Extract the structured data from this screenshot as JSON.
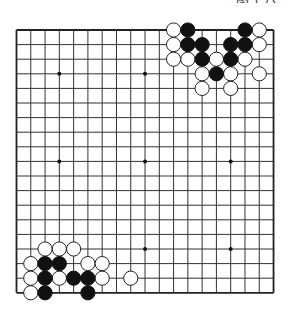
{
  "caption": {
    "text": "图十八",
    "clipped": true
  },
  "board": {
    "size": 19,
    "origin_x": 16.5,
    "origin_y": 30,
    "spacing_x": 14.28,
    "spacing_y": 14.6,
    "line_color": "#333333",
    "border_color": "#222222",
    "hoshi": [
      [
        3,
        3
      ],
      [
        3,
        9
      ],
      [
        3,
        15
      ],
      [
        9,
        3
      ],
      [
        9,
        9
      ],
      [
        9,
        15
      ],
      [
        15,
        3
      ],
      [
        15,
        9
      ],
      [
        15,
        15
      ]
    ],
    "stones": {
      "black": [
        [
          0,
          12
        ],
        [
          0,
          16
        ],
        [
          1,
          12
        ],
        [
          1,
          13
        ],
        [
          1,
          15
        ],
        [
          1,
          16
        ],
        [
          2,
          13
        ],
        [
          2,
          15
        ],
        [
          3,
          14
        ],
        [
          16,
          2
        ],
        [
          16,
          3
        ],
        [
          17,
          2
        ],
        [
          17,
          4
        ],
        [
          17,
          5
        ],
        [
          18,
          2
        ],
        [
          18,
          5
        ]
      ],
      "white": [
        [
          0,
          11
        ],
        [
          0,
          17
        ],
        [
          1,
          11
        ],
        [
          1,
          17
        ],
        [
          2,
          11
        ],
        [
          2,
          12
        ],
        [
          2,
          14
        ],
        [
          2,
          16
        ],
        [
          3,
          13
        ],
        [
          3,
          15
        ],
        [
          3,
          17
        ],
        [
          4,
          13
        ],
        [
          4,
          15
        ],
        [
          15,
          2
        ],
        [
          15,
          3
        ],
        [
          15,
          4
        ],
        [
          16,
          1
        ],
        [
          16,
          5
        ],
        [
          16,
          6
        ],
        [
          17,
          1
        ],
        [
          17,
          3
        ],
        [
          17,
          6
        ],
        [
          17,
          8
        ],
        [
          18,
          1
        ]
      ]
    },
    "stone_radius": 7.1,
    "black_color": "#111111",
    "white_fill": "#ffffff",
    "white_stroke": "#222222"
  }
}
